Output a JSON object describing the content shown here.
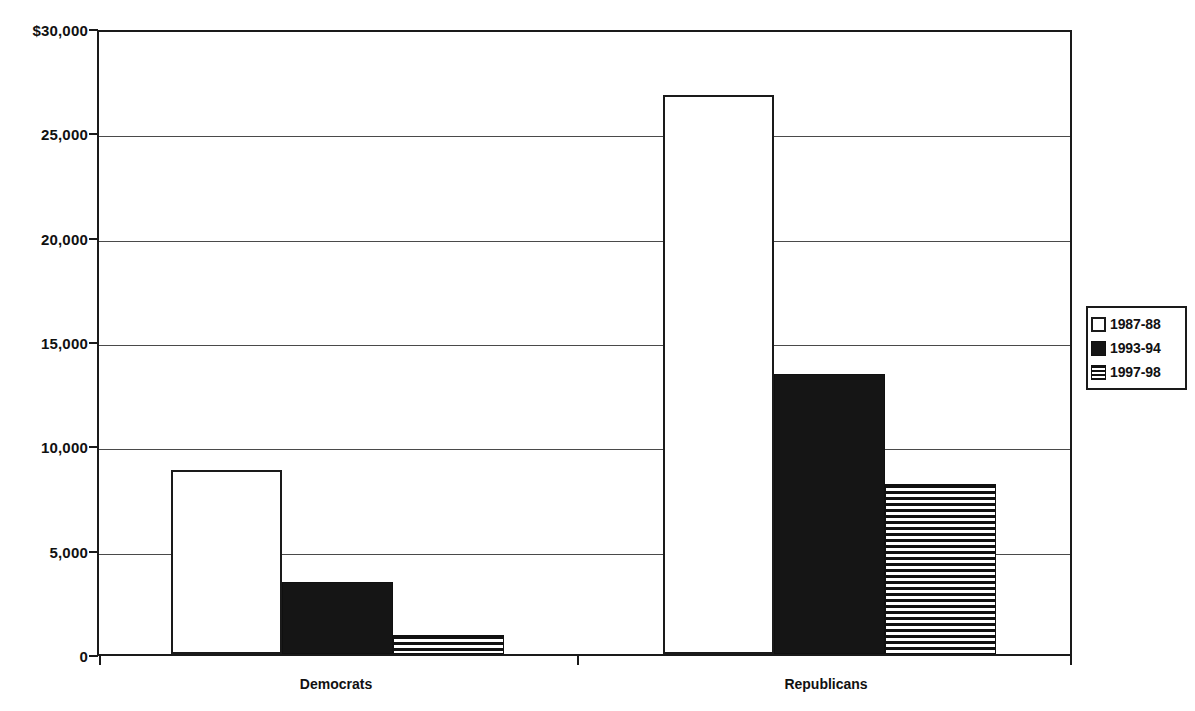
{
  "chart_data": {
    "type": "bar",
    "title": "",
    "subtitle": "",
    "xlabel": "",
    "ylabel": "",
    "categories": [
      "Democrats",
      "Republicans"
    ],
    "series": [
      {
        "name": "1987-88",
        "fill": "white",
        "values": [
          8800,
          26800
        ]
      },
      {
        "name": "1993-94",
        "fill": "black",
        "values": [
          3450,
          13400
        ]
      },
      {
        "name": "1997-98",
        "fill": "stripe",
        "values": [
          900,
          8150
        ]
      }
    ],
    "ylim": [
      0,
      30000
    ],
    "ytick_values": [
      30000,
      25000,
      20000,
      15000,
      10000,
      5000,
      0
    ],
    "ytick_labels": [
      "$30,000",
      "25,000",
      "20,000",
      "15,000",
      "10,000",
      "5,000",
      "0"
    ],
    "grid": true,
    "grid_axis": "y",
    "legend_position": "right",
    "colors": {
      "axis": "#1a1a1a",
      "grid": "#4a4a4a",
      "text": "#111111",
      "bar_white": "#ffffff",
      "bar_black": "#151515",
      "bar_stripe": "#111111",
      "background": "#ffffff"
    }
  },
  "legend": {
    "items": [
      {
        "label": "1987-88",
        "fill": "white"
      },
      {
        "label": "1993-94",
        "fill": "black"
      },
      {
        "label": "1997-98",
        "fill": "stripe"
      }
    ]
  },
  "axes": {
    "y": {
      "ticks": [
        {
          "label": "$30,000",
          "value": 30000
        },
        {
          "label": "25,000",
          "value": 25000
        },
        {
          "label": "20,000",
          "value": 20000
        },
        {
          "label": "15,000",
          "value": 15000
        },
        {
          "label": "10,000",
          "value": 10000
        },
        {
          "label": "5,000",
          "value": 5000
        },
        {
          "label": "0",
          "value": 0
        }
      ]
    },
    "x": {
      "ticks": [
        {
          "label": "Democrats"
        },
        {
          "label": "Republicans"
        }
      ]
    }
  }
}
